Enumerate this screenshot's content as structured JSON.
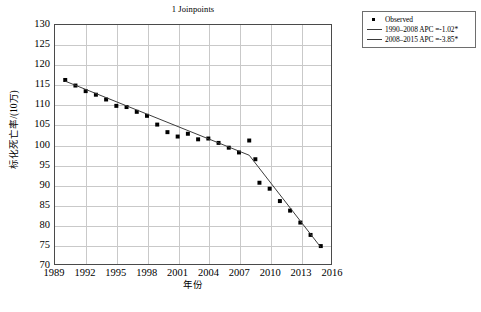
{
  "chart_data": {
    "type": "scatter",
    "title": "1 Joinpoints",
    "xlabel": "年份",
    "ylabel": "标化死亡率/(10万)",
    "xlim": [
      1989,
      2016
    ],
    "ylim": [
      70,
      130
    ],
    "xticks": [
      1989,
      1992,
      1995,
      1998,
      2001,
      2004,
      2007,
      2010,
      2013,
      2016
    ],
    "yticks": [
      70,
      75,
      80,
      85,
      90,
      95,
      100,
      105,
      110,
      115,
      120,
      125,
      130
    ],
    "grid": true,
    "legend_position": "outside-top-right",
    "series": [
      {
        "name": "Observed",
        "kind": "points",
        "x": [
          1990,
          1991,
          1992,
          1993,
          1994,
          1995,
          1996,
          1997,
          1998,
          1999,
          2000,
          2001,
          2002,
          2003,
          2004,
          2005,
          2006,
          2007,
          2008,
          2008.6,
          2009,
          2010,
          2011,
          2012,
          2013,
          2014,
          2015
        ],
        "y": [
          116.2,
          114.8,
          113.4,
          112.5,
          111.3,
          109.7,
          109.4,
          108.2,
          107.2,
          105.0,
          103.1,
          102.0,
          102.7,
          101.3,
          101.5,
          100.4,
          99.2,
          98.0,
          101.0,
          96.3,
          90.4,
          88.9,
          85.8,
          83.4,
          80.4,
          77.3,
          74.5
        ]
      },
      {
        "name": "1990–2008 APC =-1.02*",
        "kind": "trend",
        "x": [
          1990,
          2008
        ],
        "y": [
          115.9,
          97.3
        ]
      },
      {
        "name": "2008–2015 APC =-3.85*",
        "kind": "trend",
        "x": [
          2008,
          2015
        ],
        "y": [
          97.3,
          74.2
        ]
      }
    ]
  },
  "legend": {
    "items": [
      {
        "label": "Observed",
        "key": "marker"
      },
      {
        "label": "1990–2008 APC =-1.02*",
        "key": "line"
      },
      {
        "label": "2008–2015 APC =-3.85*",
        "key": "line"
      }
    ]
  },
  "colors": {
    "marker": "#000000",
    "trend_line": "#3a3a3a",
    "gridline": "#c9c9c9",
    "frame": "#4a4a4a",
    "background": "#ffffff"
  }
}
